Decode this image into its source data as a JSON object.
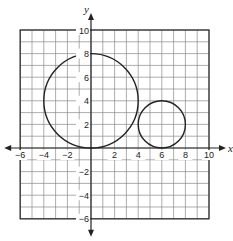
{
  "chart_data": {
    "type": "scatter",
    "title": "",
    "xlabel": "x",
    "ylabel": "y",
    "xlim": [
      -6,
      10
    ],
    "ylim": [
      -6,
      10
    ],
    "grid": true,
    "grid_step": 1,
    "x_ticks": [
      -6,
      -4,
      -2,
      2,
      4,
      6,
      8,
      10
    ],
    "y_ticks": [
      10,
      8,
      6,
      4,
      2,
      -2,
      -4,
      -6
    ],
    "x_tick_labels": [
      "−6",
      "−4",
      "−2",
      "2",
      "4",
      "6",
      "8",
      "10"
    ],
    "y_tick_labels": [
      "10",
      "8",
      "6",
      "4",
      "2",
      "−2",
      "−4",
      "−6"
    ],
    "shapes": [
      {
        "name": "large-circle",
        "kind": "circle",
        "center": [
          0,
          4
        ],
        "radius": 4
      },
      {
        "name": "small-circle",
        "kind": "circle",
        "center": [
          6,
          2
        ],
        "radius": 2
      }
    ]
  },
  "colors": {
    "grid": "#8a8a8a",
    "border": "#333333",
    "axis": "#222222",
    "curve": "#222222"
  }
}
